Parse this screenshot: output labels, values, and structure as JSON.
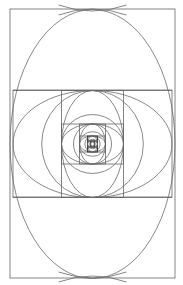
{
  "diagram": {
    "type": "recursive-nested-rectangles-with-arcs",
    "canvas": {
      "width": 183,
      "height": 285
    },
    "background": "#ffffff",
    "stroke_color": "#666666",
    "center": {
      "x": 92.5,
      "y": 144
    },
    "outer_extents": {
      "x0": 10,
      "y0": 9,
      "x1": 175,
      "y1": 278
    },
    "ratio": 0.618,
    "levels": 9,
    "top_cross": {
      "x": 92.5,
      "y": 9
    },
    "bottom_cross": {
      "x": 92.5,
      "y": 278
    },
    "labels": []
  }
}
